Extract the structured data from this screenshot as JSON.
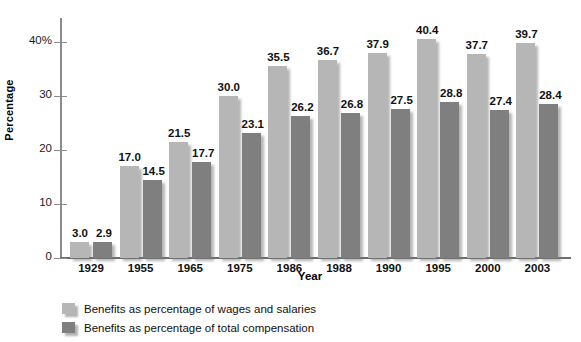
{
  "chart_data": {
    "type": "bar",
    "title": "",
    "xlabel": "Year",
    "ylabel": "Percentage",
    "ylim": [
      0,
      44
    ],
    "yticks": [
      "0",
      "10",
      "20",
      "30",
      "40%"
    ],
    "ytick_values": [
      0,
      10,
      20,
      30,
      40
    ],
    "grid": false,
    "legend_position": "bottom-left",
    "categories": [
      "1929",
      "1955",
      "1965",
      "1975",
      "1986",
      "1988",
      "1990",
      "1995",
      "2000",
      "2003"
    ],
    "series": [
      {
        "name": "Benefits as percentage of wages and salaries",
        "color": "#b6b6b6",
        "values": [
          3.0,
          17.0,
          21.5,
          30.0,
          35.5,
          36.7,
          37.9,
          40.4,
          37.7,
          39.7
        ],
        "labels": [
          "3.0",
          "17.0",
          "21.5",
          "30.0",
          "35.5",
          "36.7",
          "37.9",
          "40.4",
          "37.7",
          "39.7"
        ]
      },
      {
        "name": "Benefits as percentage of total compensation",
        "color": "#7f7f7f",
        "values": [
          2.9,
          14.5,
          17.7,
          23.1,
          26.2,
          26.8,
          27.5,
          28.8,
          27.4,
          28.4
        ],
        "labels": [
          "2.9",
          "14.5",
          "17.7",
          "23.1",
          "26.2",
          "26.8",
          "27.5",
          "28.8",
          "27.4",
          "28.4"
        ]
      }
    ]
  },
  "legend": {
    "items": [
      {
        "label": "Benefits as percentage of wages and salaries",
        "color": "#b6b6b6"
      },
      {
        "label": "Benefits as percentage of total compensation",
        "color": "#7f7f7f"
      }
    ]
  }
}
